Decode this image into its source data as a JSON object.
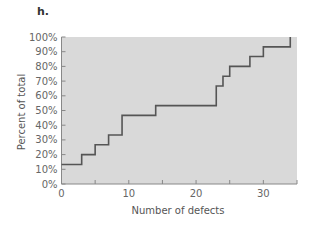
{
  "panel_label": "h.",
  "chart_data": {
    "type": "line",
    "subtype": "step (cumulative)",
    "title": "",
    "xlabel": "Number of defects",
    "ylabel": "Percent of total",
    "xlim": [
      0,
      35
    ],
    "ylim": [
      0,
      100
    ],
    "x_ticks": [
      0,
      5,
      10,
      15,
      20,
      25,
      30
    ],
    "x_tick_labels": [
      "0",
      "10",
      "20",
      "30"
    ],
    "y_tick_labels": [
      "0%",
      "10%",
      "20%",
      "30%",
      "40%",
      "50%",
      "60%",
      "70%",
      "80%",
      "90%",
      "100%"
    ],
    "grid": false,
    "legend": null,
    "series": [
      {
        "name": "Cumulative percent",
        "x": [
          0,
          3,
          5,
          7,
          9,
          14,
          23,
          24,
          25,
          28,
          30,
          34
        ],
        "values": [
          13.3,
          20.0,
          26.7,
          33.3,
          46.7,
          53.3,
          66.7,
          73.3,
          80.0,
          86.7,
          93.3,
          100.0
        ]
      }
    ],
    "colors": {
      "plot_background": "#d9d9d9",
      "line": "#555555",
      "axis": "#888888"
    }
  }
}
